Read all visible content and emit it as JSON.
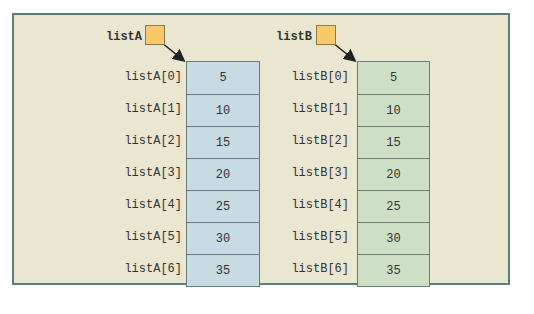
{
  "arrays": [
    {
      "name": "listA",
      "color": "#c7dbe2",
      "labels": [
        "listA[0]",
        "listA[1]",
        "listA[2]",
        "listA[3]",
        "listA[4]",
        "listA[5]",
        "listA[6]"
      ],
      "values": [
        "5",
        "10",
        "15",
        "20",
        "25",
        "30",
        "35"
      ]
    },
    {
      "name": "listB",
      "color": "#cde0c6",
      "labels": [
        "listB[0]",
        "listB[1]",
        "listB[2]",
        "listB[3]",
        "listB[4]",
        "listB[5]",
        "listB[6]"
      ],
      "values": [
        "5",
        "10",
        "15",
        "20",
        "25",
        "30",
        "35"
      ]
    }
  ]
}
